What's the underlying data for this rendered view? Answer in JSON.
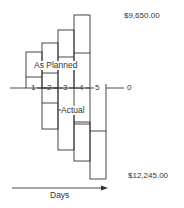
{
  "diagram": {
    "top_value": "$9,650.00",
    "bottom_value": "$12,245.00",
    "zero_label": "0",
    "planned_label": "As Planned",
    "actual_label": "Actual",
    "x_axis_label": "Days",
    "axis_ticks": [
      "1",
      "2",
      "3",
      "4",
      "5"
    ],
    "line_color": "#333333",
    "text_color": "#333333"
  }
}
